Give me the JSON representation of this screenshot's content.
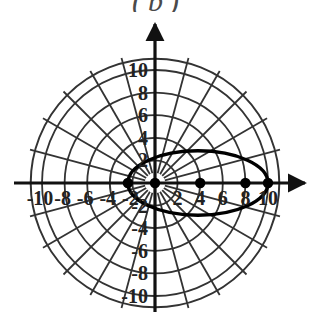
{
  "figure": {
    "caption": "(b)",
    "type": "polar-plot"
  },
  "chart_data": {
    "type": "line",
    "title": "(b)",
    "coordinate_system": "polar",
    "xlabel": "",
    "ylabel": "",
    "xlim": [
      -11,
      11
    ],
    "ylim": [
      -11,
      11
    ],
    "grid": true,
    "grid_circles_r": [
      2,
      4,
      6,
      8,
      10,
      11
    ],
    "grid_spoke_step_deg": 15,
    "x_tick_labels": [
      "-10",
      "-8",
      "-6",
      "-4",
      "-2",
      "2",
      "4",
      "6",
      "8",
      "10"
    ],
    "x_tick_values": [
      -10,
      -8,
      -6,
      -4,
      -2,
      2,
      4,
      6,
      8,
      10
    ],
    "y_tick_labels": [
      "10",
      "8",
      "6",
      "4",
      "2",
      "-2",
      "-4",
      "-6",
      "-8",
      "-10"
    ],
    "y_tick_values": [
      10,
      8,
      6,
      4,
      2,
      -2,
      -4,
      -6,
      -8,
      -10
    ],
    "series": [
      {
        "name": "closed-oval-curve",
        "style": "solid-bold",
        "color": "#000000",
        "center_x": 3.8,
        "center_y": 0,
        "semi_axis_x": 6.2,
        "semi_axis_y": 2.85,
        "x_min": -2.4,
        "x_max": 10.0,
        "y_min": -2.85,
        "y_max": 2.85
      }
    ],
    "marked_points": [
      {
        "label": "",
        "x": -2.4,
        "y": 0
      },
      {
        "label": "",
        "x": 0,
        "y": 0
      },
      {
        "label": "",
        "x": 4.0,
        "y": 0
      },
      {
        "label": "",
        "x": 8.0,
        "y": 0
      },
      {
        "label": "",
        "x": 10.0,
        "y": 0
      }
    ],
    "axis_color": "#111111",
    "grid_color": "#333333",
    "curve_color": "#000000",
    "point_color": "#000000"
  }
}
